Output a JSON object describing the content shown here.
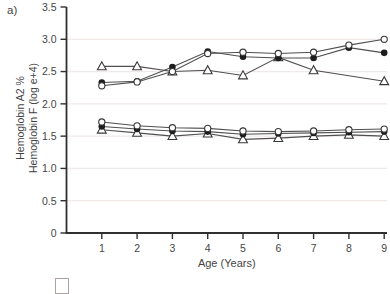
{
  "figure": {
    "panel_label": "a)",
    "x_axis_label": "Age (Years)",
    "y_axis_label_line1": "Hemoglobin A2 %",
    "y_axis_label_line2": "Hemoglobin F (log e+4)"
  },
  "colors": {
    "axis": "#303030",
    "tick_text": "#454545",
    "grid": "#efe9e7",
    "line": "#4f4f4f",
    "marker_stroke": "#383838",
    "marker_fill_dark": "#1d1d1d",
    "marker_fill_open": "#ffffff"
  },
  "chart_data": {
    "type": "line",
    "title": "",
    "xlabel": "Age (Years)",
    "ylabel": "Hemoglobin A2 %  Hemoglobin F (log e+4)",
    "xlim": [
      0,
      9.1
    ],
    "ylim": [
      0,
      3.5
    ],
    "xticks": [
      1,
      2,
      3,
      4,
      5,
      6,
      7,
      8,
      9
    ],
    "xtick_labels": [
      "1",
      "2",
      "3",
      "4",
      "5",
      "6",
      "7",
      "8",
      "9"
    ],
    "yticks": [
      0,
      0.5,
      1.0,
      1.5,
      2.0,
      2.5,
      3.0,
      3.5
    ],
    "ytick_labels": [
      "0",
      "0.5",
      "1.0",
      "1.5",
      "2.0",
      "2.5",
      "3.0",
      "3.5"
    ],
    "gridlines": [
      0.5,
      1.0,
      1.5,
      2.0,
      2.5,
      3.0
    ],
    "grid": "faint-horizontal",
    "legend": "none",
    "series": [
      {
        "name": "upper-open-triangle",
        "marker": "open-triangle",
        "x": [
          1,
          2,
          3,
          4,
          5,
          6,
          7,
          9
        ],
        "y": [
          2.58,
          2.58,
          2.5,
          2.52,
          2.44,
          2.72,
          2.52,
          2.35
        ]
      },
      {
        "name": "upper-filled-circle",
        "marker": "filled-circle",
        "x": [
          1,
          2,
          3,
          4,
          5,
          6,
          7,
          8,
          9
        ],
        "y": [
          2.33,
          2.35,
          2.57,
          2.81,
          2.73,
          2.71,
          2.71,
          2.87,
          2.79
        ]
      },
      {
        "name": "upper-open-circle",
        "marker": "open-circle",
        "x": [
          1,
          2,
          3,
          4,
          5,
          6,
          7,
          8,
          9
        ],
        "y": [
          2.28,
          2.34,
          2.5,
          2.78,
          2.8,
          2.78,
          2.8,
          2.91,
          3.0
        ]
      },
      {
        "name": "lower-open-triangle",
        "marker": "open-triangle",
        "x": [
          1,
          2,
          3,
          4,
          5,
          6,
          7,
          8,
          9
        ],
        "y": [
          1.6,
          1.55,
          1.5,
          1.54,
          1.45,
          1.47,
          1.5,
          1.52,
          1.5
        ]
      },
      {
        "name": "lower-filled-circle",
        "marker": "filled-circle",
        "x": [
          1,
          2,
          3,
          4,
          5,
          6,
          7,
          8,
          9
        ],
        "y": [
          1.65,
          1.61,
          1.58,
          1.57,
          1.53,
          1.54,
          1.55,
          1.56,
          1.57
        ]
      },
      {
        "name": "lower-open-circle",
        "marker": "open-circle",
        "x": [
          1,
          2,
          3,
          4,
          5,
          6,
          7,
          8,
          9
        ],
        "y": [
          1.72,
          1.66,
          1.63,
          1.62,
          1.58,
          1.57,
          1.58,
          1.6,
          1.61
        ]
      }
    ]
  }
}
